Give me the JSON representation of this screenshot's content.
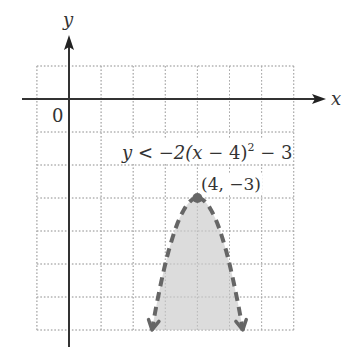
{
  "figure": {
    "axis_labels": {
      "x": "x",
      "y": "y"
    },
    "origin_label": "0",
    "inequality": {
      "prefix": "y < −2(",
      "var": "x",
      "mid": " − 4)",
      "exp": "2",
      "suffix": " − 3"
    },
    "vertex_label": "(4, −3)"
  },
  "chart_data": {
    "type": "inequality-graph",
    "title": "",
    "inequality": "y < -2(x - 4)^2 - 3",
    "boundary": {
      "a": -2,
      "h": 4,
      "k": -3,
      "style": "dashed"
    },
    "vertex": [
      4,
      -3
    ],
    "shaded_region": "inside/below parabola",
    "xlim": [
      -1,
      7
    ],
    "ylim": [
      -7,
      1
    ],
    "grid": true,
    "grid_style": "dotted",
    "colors": {
      "axis": "#333333",
      "grid": "#aaaaaa",
      "curve": "#666666",
      "shade": "#dcdcdc"
    }
  }
}
